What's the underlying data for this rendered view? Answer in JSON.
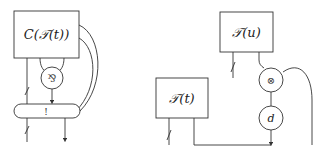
{
  "diagrams": [
    {
      "id": "left",
      "boxes": [
        {
          "label": "C(𝒯(t))"
        }
      ],
      "nodes": [
        {
          "label": "⅋",
          "shape": "circle"
        },
        {
          "label": "!",
          "shape": "pill"
        }
      ]
    },
    {
      "id": "right",
      "boxes": [
        {
          "label": "𝒯(u)"
        },
        {
          "label": "𝒯(t)"
        }
      ],
      "nodes": [
        {
          "label": "⊗",
          "shape": "circle"
        },
        {
          "label": "d",
          "shape": "circle"
        }
      ]
    }
  ]
}
